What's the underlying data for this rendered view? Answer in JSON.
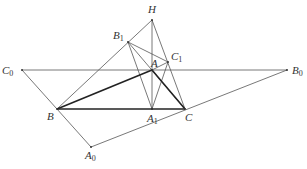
{
  "diagram": {
    "type": "geometry-figure",
    "points": [
      {
        "id": "H",
        "label": "H",
        "sub": ""
      },
      {
        "id": "B1",
        "label": "B",
        "sub": "1"
      },
      {
        "id": "C1",
        "label": "C",
        "sub": "1"
      },
      {
        "id": "A",
        "label": "A",
        "sub": ""
      },
      {
        "id": "C0",
        "label": "C",
        "sub": "0"
      },
      {
        "id": "B0",
        "label": "B",
        "sub": "0"
      },
      {
        "id": "B",
        "label": "B",
        "sub": ""
      },
      {
        "id": "A1",
        "label": "A",
        "sub": "1"
      },
      {
        "id": "C",
        "label": "C",
        "sub": ""
      },
      {
        "id": "A0",
        "label": "A",
        "sub": "0"
      }
    ],
    "segments": [
      {
        "from": "C0",
        "to": "B0",
        "style": "thin"
      },
      {
        "from": "C0",
        "to": "A0",
        "style": "thin"
      },
      {
        "from": "A0",
        "to": "B0",
        "style": "thin"
      },
      {
        "from": "B",
        "to": "H",
        "style": "thin"
      },
      {
        "from": "H",
        "to": "C",
        "style": "thin"
      },
      {
        "from": "H",
        "to": "A1",
        "style": "thin"
      },
      {
        "from": "B1",
        "to": "A1",
        "style": "thin"
      },
      {
        "from": "B1",
        "to": "C1",
        "style": "thin"
      },
      {
        "from": "B1",
        "to": "C",
        "style": "thin"
      },
      {
        "from": "C1",
        "to": "A1",
        "style": "thin"
      },
      {
        "from": "A",
        "to": "C1",
        "style": "thin"
      },
      {
        "from": "B",
        "to": "A",
        "style": "thick"
      },
      {
        "from": "A",
        "to": "C",
        "style": "thick"
      },
      {
        "from": "B",
        "to": "C",
        "style": "thick"
      }
    ]
  }
}
